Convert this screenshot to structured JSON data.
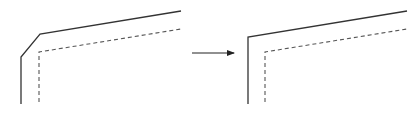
{
  "diagram": {
    "width": 418,
    "height": 117,
    "stroke_color": "#333333",
    "dashed_color": "#555555",
    "arrow_color": "#222222",
    "figures": [
      {
        "name": "before-chamfered-corner",
        "solid_path": [
          [
            21,
            104
          ],
          [
            21,
            57
          ],
          [
            40,
            34
          ],
          [
            181,
            11
          ]
        ],
        "dashed_path": [
          [
            39,
            102
          ],
          [
            39,
            52
          ],
          [
            181,
            29
          ]
        ]
      },
      {
        "name": "after-sharp-corner",
        "solid_path": [
          [
            248,
            104
          ],
          [
            248,
            37
          ],
          [
            407,
            11
          ]
        ],
        "dashed_path": [
          [
            265,
            102
          ],
          [
            265,
            52
          ],
          [
            407,
            29
          ]
        ]
      }
    ],
    "arrow": {
      "from": [
        192,
        53
      ],
      "to": [
        234,
        53
      ]
    }
  }
}
